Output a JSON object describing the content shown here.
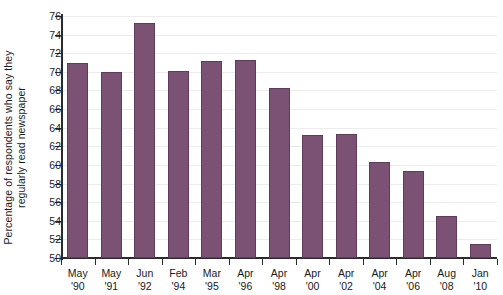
{
  "chart_data": {
    "type": "bar",
    "title": "",
    "subtitle": "",
    "xlabel": "",
    "ylabel": "Percentage of respondents who say they regularly read newspaper",
    "ylabel_lines": [
      "Percentage of respondents who say they",
      "regularly read newspaper"
    ],
    "categories": [
      "May '90",
      "May '91",
      "Jun '92",
      "Feb '94",
      "Mar '95",
      "Apr '96",
      "Apr '98",
      "Apr '00",
      "Apr '02",
      "Apr '04",
      "Apr '06",
      "Aug '08",
      "Jan '10"
    ],
    "category_lines": [
      [
        "May",
        "'90"
      ],
      [
        "May",
        "'91"
      ],
      [
        "Jun",
        "'92"
      ],
      [
        "Feb",
        "'94"
      ],
      [
        "Mar",
        "'95"
      ],
      [
        "Apr",
        "'96"
      ],
      [
        "Apr",
        "'98"
      ],
      [
        "Apr",
        "'00"
      ],
      [
        "Apr",
        "'02"
      ],
      [
        "Apr",
        "'04"
      ],
      [
        "Apr",
        "'06"
      ],
      [
        "Aug",
        "'08"
      ],
      [
        "Jan",
        "'10"
      ]
    ],
    "values": [
      71.0,
      70.0,
      75.2,
      70.1,
      71.2,
      71.3,
      68.3,
      63.2,
      63.3,
      60.3,
      59.3,
      54.5,
      51.5
    ],
    "ylim": [
      50,
      76
    ],
    "ytick_step": 2,
    "yticks": [
      50,
      52,
      54,
      56,
      58,
      60,
      62,
      64,
      66,
      68,
      70,
      72,
      74,
      76
    ],
    "ytick_labels": [
      "50",
      "52",
      "54",
      "56",
      "58",
      "60",
      "62",
      "64",
      "66",
      "68",
      "70",
      "72",
      "74",
      "76"
    ],
    "grid": true,
    "legend": false,
    "legend_position": "none",
    "bar_color": "#7b5274",
    "bar_edge_color": "#5f3c5a",
    "axis_color": "#2b2b2b",
    "grid_color": "#ececed",
    "background_color": "#ffffff"
  }
}
